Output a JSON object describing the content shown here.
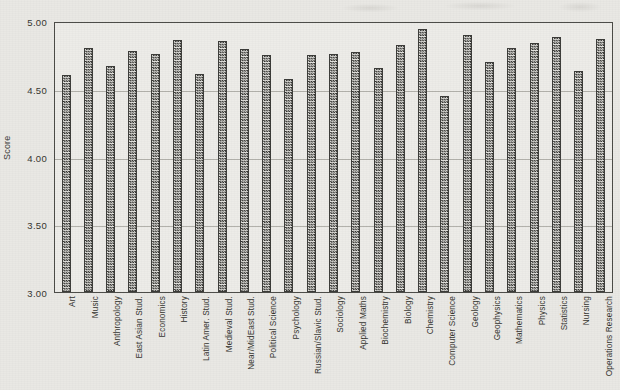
{
  "chart_data": {
    "type": "bar",
    "title": "",
    "xlabel": "",
    "ylabel": "Score",
    "ylim": [
      3.0,
      5.0
    ],
    "ytick_labels": [
      "5.00",
      "4.50",
      "4.00",
      "3.50",
      "3.00"
    ],
    "yticks": [
      5.0,
      4.5,
      4.0,
      3.5,
      3.0
    ],
    "grid": true,
    "legend": null,
    "categories": [
      "Art",
      "Music",
      "Anthropology",
      "East Asian Stud.",
      "Economics",
      "History",
      "Latin Amer. Stud.",
      "Medieval Stud.",
      "Near/MidEast Stud.",
      "Political Science",
      "Psychology",
      "Russian/Slavic Stud.",
      "Sociology",
      "Applied Maths",
      "Biochemistry",
      "Biology",
      "Chemistry",
      "Computer Science",
      "Geology",
      "Geophysics",
      "Mathematics",
      "Physics",
      "Statistics",
      "Nursing",
      "Operations Research"
    ],
    "values": [
      4.6,
      4.8,
      4.67,
      4.78,
      4.76,
      4.86,
      4.61,
      4.85,
      4.79,
      4.75,
      4.57,
      4.75,
      4.76,
      4.77,
      4.65,
      4.82,
      4.94,
      4.45,
      4.9,
      4.7,
      4.8,
      4.84,
      4.88,
      4.63,
      4.87
    ]
  },
  "colors": {
    "background": "#e9e8e4",
    "plot_background": "#edece8",
    "axis": "#4b4b47",
    "gridline": "#b2b1ab",
    "bar_outline": "#3b3b38",
    "bar_fill_dark": "#2f2f2c",
    "bar_fill_light": "#e4e3df",
    "text": "#34342f"
  }
}
